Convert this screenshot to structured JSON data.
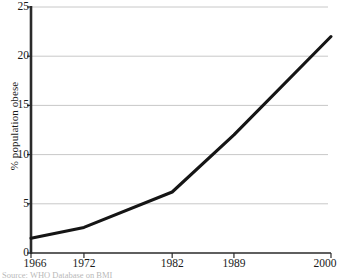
{
  "chart_data": {
    "type": "line",
    "title": "",
    "xlabel": "",
    "ylabel": "% population obese",
    "x": [
      1966,
      1972,
      1982,
      1989,
      2000
    ],
    "values": [
      1.5,
      2.6,
      6.2,
      12.0,
      22.0
    ],
    "xtick_labels": [
      "1966",
      "1972",
      "1982",
      "1989",
      "2000"
    ],
    "ytick_labels": [
      "0",
      "5",
      "10",
      "15",
      "20",
      "25"
    ],
    "ytick_values": [
      0,
      5,
      10,
      15,
      20,
      25
    ],
    "xlim": [
      1966,
      2000
    ],
    "ylim": [
      0,
      25
    ],
    "grid": "horizontal",
    "legend": "none",
    "line_color": "#151515",
    "grid_color": "#c8c8c8",
    "axis_color": "#2a2a2a"
  },
  "axis": {
    "y_title": "% population obese"
  },
  "caption": {
    "text": "Source: WHO Database on BMI"
  }
}
